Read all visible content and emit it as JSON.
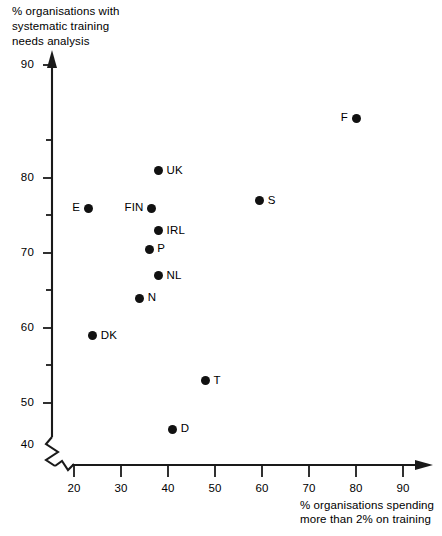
{
  "chart_data": {
    "type": "scatter",
    "title": "",
    "ylabel": "% organisations with\nsystematic training\nneeds analysis",
    "xlabel": "% organisations spending\nmore than 2% on training",
    "xlim": [
      15,
      95
    ],
    "ylim": [
      40,
      92
    ],
    "grid": false,
    "legend": "none",
    "axis_break": true,
    "x_ticks": [
      20,
      30,
      40,
      50,
      60,
      70,
      80,
      90
    ],
    "x_tick_labels": [
      "20",
      "30",
      "40",
      "50",
      "60",
      "70",
      "80",
      "90"
    ],
    "y_ticks": [
      40,
      50,
      60,
      70,
      80,
      90
    ],
    "y_tick_labels": [
      "40",
      "50",
      "60",
      "70",
      "80",
      "90"
    ],
    "y_minor_ticks": [
      45,
      55,
      65,
      75,
      85
    ],
    "points": [
      {
        "label": "F",
        "x": 80.0,
        "y": 88.0,
        "label_side": "left"
      },
      {
        "label": "UK",
        "x": 38.0,
        "y": 81.0,
        "label_side": "right"
      },
      {
        "label": "S",
        "x": 59.5,
        "y": 77.0,
        "label_side": "right"
      },
      {
        "label": "E",
        "x": 23.0,
        "y": 76.0,
        "label_side": "left"
      },
      {
        "label": "FIN",
        "x": 36.5,
        "y": 76.0,
        "label_side": "left"
      },
      {
        "label": "IRL",
        "x": 38.0,
        "y": 73.0,
        "label_side": "right"
      },
      {
        "label": "P",
        "x": 36.0,
        "y": 70.5,
        "label_side": "right"
      },
      {
        "label": "NL",
        "x": 38.0,
        "y": 67.0,
        "label_side": "right"
      },
      {
        "label": "N",
        "x": 34.0,
        "y": 64.0,
        "label_side": "right"
      },
      {
        "label": "DK",
        "x": 24.0,
        "y": 59.0,
        "label_side": "right"
      },
      {
        "label": "T",
        "x": 48.0,
        "y": 53.0,
        "label_side": "right"
      },
      {
        "label": "D",
        "x": 41.0,
        "y": 46.5,
        "label_side": "right"
      }
    ],
    "marker_color": "#111111",
    "axis_color": "#1a1a1a"
  }
}
